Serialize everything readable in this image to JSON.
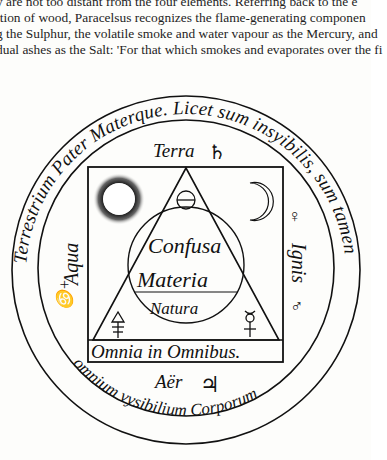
{
  "page": {
    "text_lines": [
      "y are not too distant from the four elements. Referring back to the e",
      "ition of wood, Paracelsus recognizes the flame-generating componen",
      "g the Sulphur, the volatile smoke and water vapour as the Mercury, and",
      "dual ashes as the Salt: 'For that which smokes and evaporates over the fi"
    ]
  },
  "figure": {
    "outer_ring_text": "Terrestrium Pater Materque. Licet sum insyibilis, sum tamen omnium visibilium Corporum",
    "outer_ring_top": "Terrestrium Pater Materque. Licet sum insyibilis, sum tamen",
    "outer_ring_bottom": "omnium vysibilium Corporum",
    "labels": {
      "terra": "Terra",
      "aqua": "Aqua",
      "ignis": "Ignis",
      "aer": "Aër",
      "confusa": "Confusa",
      "materia": "Materia",
      "natura": "Natura",
      "omnia": "Omnia in Omnibus."
    },
    "symbols": {
      "saturn": "♄",
      "jupiter": "♃",
      "venus": "♀",
      "mars": "♂",
      "salt": "⊖",
      "moon": "☾",
      "sulphur": "🜍",
      "mercury": "☿",
      "aqua_symbol": "♋"
    },
    "colors": {
      "ink": "#111111",
      "paper": "#fdfdfb"
    }
  }
}
